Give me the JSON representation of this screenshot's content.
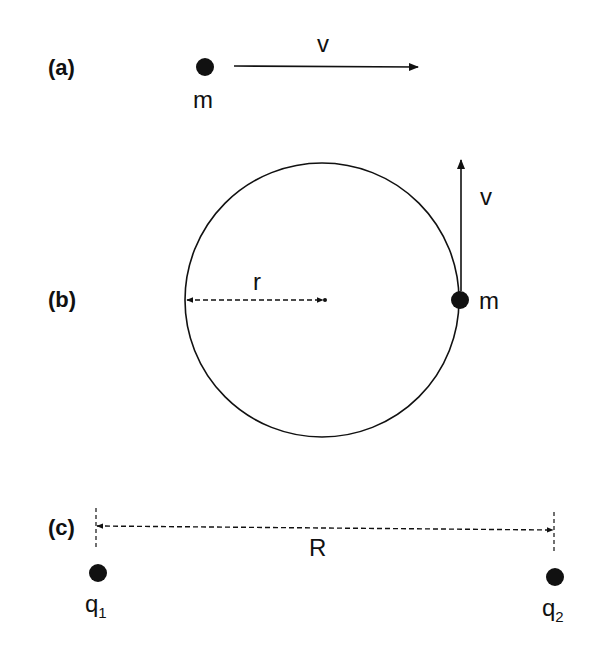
{
  "diagram": {
    "panels": [
      {
        "id": "a",
        "label": "(a)",
        "mass_label": "m",
        "velocity_label": "v",
        "description": "point mass m moving in a straight line with velocity v"
      },
      {
        "id": "b",
        "label": "(b)",
        "mass_label": "m",
        "velocity_label": "v",
        "radius_label": "r",
        "description": "point mass m moving on a circle of radius r with tangential velocity v"
      },
      {
        "id": "c",
        "label": "(c)",
        "charge1_label": "q",
        "charge1_sub": "1",
        "charge2_label": "q",
        "charge2_sub": "2",
        "distance_label": "R",
        "description": "two point charges q1 and q2 separated by distance R"
      }
    ],
    "colors": {
      "ink": "#111111",
      "background": "#ffffff"
    }
  }
}
